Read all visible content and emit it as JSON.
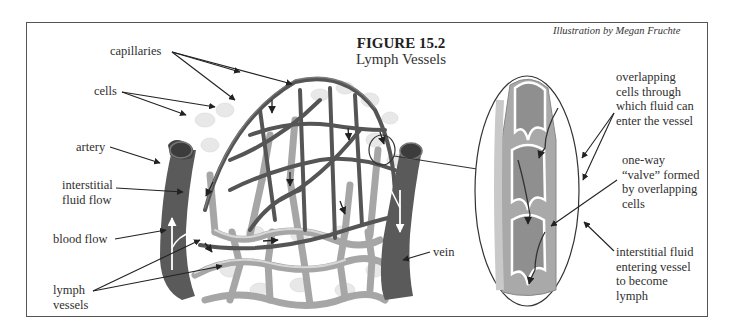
{
  "figure": {
    "number": "FIGURE 15.2",
    "title": "Lymph Vessels",
    "credit": "Illustration by Megan Fruchte"
  },
  "labels": {
    "capillaries": "capillaries",
    "cells": "cells",
    "artery": "artery",
    "interstitial_fluid_flow": "interstitial\nfluid flow",
    "blood_flow": "blood flow",
    "lymph_vessels": "lymph\nvessels",
    "vein": "vein"
  },
  "inset_labels": {
    "overlapping_cells": "overlapping\ncells through\nwhich fluid can\nenter the vessel",
    "one_way_valve": "one-way\n“valve” formed\nby overlapping\ncells",
    "interstitial_fluid_entering": "interstitial fluid\nentering vessel\nto become\nlymph"
  },
  "colors": {
    "frame": "#555555",
    "blood_vessel": "#5a5a5a",
    "lymph_vessel": "#a8a8a8",
    "cells": "#e6e6e6",
    "inset_fill": "#9a9a9a"
  }
}
